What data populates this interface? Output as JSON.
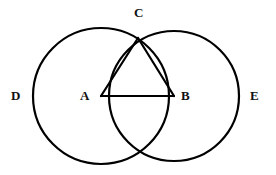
{
  "figure": {
    "type": "two-intersecting-circles-with-inscribed-triangle",
    "background_color": "#ffffff",
    "stroke_color": "#000000",
    "stroke_width": 2.2,
    "label_color": "#111111",
    "labels": {
      "c": "C",
      "d": "D",
      "a": "A",
      "b": "B",
      "e": "E"
    },
    "geometry": {
      "left_circle": {
        "cx": 101,
        "cy": 96,
        "r": 68
      },
      "right_circle": {
        "cx": 174,
        "cy": 96,
        "r": 65
      },
      "points": {
        "A": {
          "x": 101,
          "y": 96
        },
        "B": {
          "x": 174,
          "y": 96
        },
        "C": {
          "x": 138,
          "y": 38
        },
        "bottom_intersection": {
          "x": 138,
          "y": 157
        }
      },
      "segments": [
        {
          "name": "AB",
          "x1": 101,
          "y1": 96,
          "x2": 174,
          "y2": 96
        },
        {
          "name": "AC",
          "x1": 101,
          "y1": 96,
          "x2": 138,
          "y2": 38
        },
        {
          "name": "BC",
          "x1": 174,
          "y1": 96,
          "x2": 138,
          "y2": 38
        }
      ]
    }
  },
  "chart_data": {
    "type": "diagram",
    "title": "",
    "elements": [
      {
        "kind": "circle",
        "label": "D",
        "center": "A",
        "cx": 101,
        "cy": 96,
        "r": 68
      },
      {
        "kind": "circle",
        "label": "E",
        "center": "B",
        "cx": 174,
        "cy": 96,
        "r": 65
      },
      {
        "kind": "triangle",
        "vertices": [
          "A",
          "B",
          "C"
        ]
      }
    ],
    "point_labels": [
      "A",
      "B",
      "C",
      "D",
      "E"
    ]
  }
}
